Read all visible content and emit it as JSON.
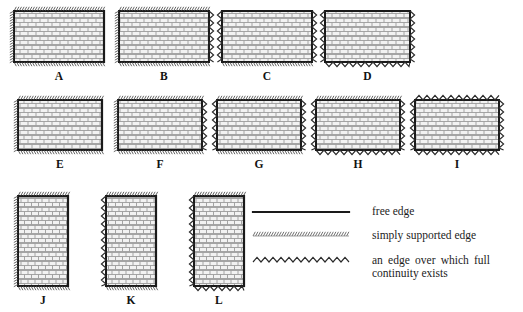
{
  "figure": {
    "title": "",
    "edge_styles": {
      "free": {
        "name": "free edge",
        "render": "solid-line",
        "color": "#1a1a1a"
      },
      "simply_supported": {
        "name": "simply supported edge",
        "render": "dense-hatch",
        "color": "#3a3a3a"
      },
      "continuous": {
        "name": "an edge over which full continuity exists",
        "render": "zigzag",
        "color": "#2a2a2a"
      }
    },
    "brick_fill": {
      "brick_color": "#f2f2f2",
      "mortar_color": "#9a9a9a",
      "outline_color": "#1a1a1a"
    }
  },
  "panels": [
    {
      "id": "A",
      "label": "A",
      "orientation": "landscape",
      "x": 14,
      "y": 11,
      "w": 90,
      "h": 51,
      "edges": {
        "top": "simply_supported",
        "right": "free",
        "bottom": "simply_supported",
        "left": "simply_supported"
      }
    },
    {
      "id": "B",
      "label": "B",
      "orientation": "landscape",
      "x": 119,
      "y": 11,
      "w": 90,
      "h": 51,
      "edges": {
        "top": "simply_supported",
        "right": "continuous",
        "bottom": "simply_supported",
        "left": "simply_supported"
      }
    },
    {
      "id": "C",
      "label": "C",
      "orientation": "landscape",
      "x": 222,
      "y": 11,
      "w": 90,
      "h": 51,
      "edges": {
        "top": "free",
        "right": "continuous",
        "bottom": "simply_supported",
        "left": "continuous"
      }
    },
    {
      "id": "D",
      "label": "D",
      "orientation": "landscape",
      "x": 325,
      "y": 11,
      "w": 85,
      "h": 51,
      "edges": {
        "top": "free",
        "right": "continuous",
        "bottom": "continuous",
        "left": "continuous"
      }
    },
    {
      "id": "E",
      "label": "E",
      "orientation": "landscape",
      "x": 18,
      "y": 100,
      "w": 84,
      "h": 50,
      "edges": {
        "top": "simply_supported",
        "right": "free",
        "bottom": "simply_supported",
        "left": "simply_supported"
      }
    },
    {
      "id": "F",
      "label": "F",
      "orientation": "landscape",
      "x": 118,
      "y": 100,
      "w": 84,
      "h": 50,
      "edges": {
        "top": "simply_supported",
        "right": "continuous",
        "bottom": "simply_supported",
        "left": "simply_supported"
      }
    },
    {
      "id": "G",
      "label": "G",
      "orientation": "landscape",
      "x": 217,
      "y": 100,
      "w": 84,
      "h": 50,
      "edges": {
        "top": "simply_supported",
        "right": "continuous",
        "bottom": "simply_supported",
        "left": "continuous"
      }
    },
    {
      "id": "H",
      "label": "H",
      "orientation": "landscape",
      "x": 316,
      "y": 100,
      "w": 84,
      "h": 50,
      "edges": {
        "top": "simply_supported",
        "right": "continuous",
        "bottom": "continuous",
        "left": "continuous"
      }
    },
    {
      "id": "I",
      "label": "I",
      "orientation": "landscape",
      "x": 415,
      "y": 100,
      "w": 84,
      "h": 50,
      "edges": {
        "top": "continuous",
        "right": "continuous",
        "bottom": "continuous",
        "left": "continuous"
      }
    },
    {
      "id": "J",
      "label": "J",
      "orientation": "portrait",
      "x": 18,
      "y": 196,
      "w": 50,
      "h": 90,
      "edges": {
        "top": "simply_supported",
        "right": "free",
        "bottom": "simply_supported",
        "left": "simply_supported"
      }
    },
    {
      "id": "K",
      "label": "K",
      "orientation": "portrait",
      "x": 106,
      "y": 196,
      "w": 50,
      "h": 90,
      "edges": {
        "top": "simply_supported",
        "right": "free",
        "bottom": "simply_supported",
        "left": "continuous"
      }
    },
    {
      "id": "L",
      "label": "L",
      "orientation": "portrait",
      "x": 194,
      "y": 196,
      "w": 50,
      "h": 90,
      "edges": {
        "top": "simply_supported",
        "right": "free",
        "bottom": "continuous",
        "left": "continuous"
      }
    }
  ],
  "legend": {
    "items": [
      {
        "key": "free",
        "sample": "solid-line",
        "text": "free edge"
      },
      {
        "key": "simply_supported",
        "sample": "dense-hatch",
        "text": "simply supported edge"
      },
      {
        "key": "continuous",
        "sample": "zigzag",
        "text": "an edge over which full continuity exists"
      }
    ]
  }
}
